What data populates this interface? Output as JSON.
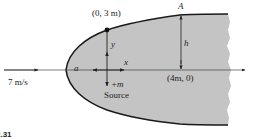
{
  "figure": {
    "point_label": "(0, 3 m)",
    "stagnation_label": "a",
    "freestream_speed": "7 m/s",
    "source_strength": "+m",
    "source_label": "Source",
    "x_axis_label": "x",
    "y_axis_label": "y",
    "point_a_label": "A",
    "height_label": "h",
    "x_point_label": "(4m, 0)",
    "figure_number": "2.31"
  },
  "colors": {
    "body_fill": "#c4c4c4",
    "outline": "#1a1a1a",
    "axis": "#333333"
  }
}
